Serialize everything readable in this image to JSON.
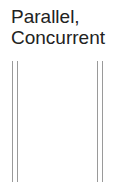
{
  "label": {
    "line1": "Parallel,",
    "line2": "Concurrent"
  },
  "lines": {
    "color": "#9a9a9a",
    "left_pair_x": [
      12,
      17
    ],
    "right_pair_x": [
      97,
      102
    ]
  }
}
